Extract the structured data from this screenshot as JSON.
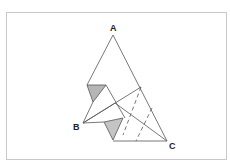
{
  "figure": {
    "type": "geometry",
    "labels": {
      "A": "A",
      "B": "B",
      "C": "C"
    },
    "points": {
      "A": [
        113,
        35
      ],
      "B": [
        83,
        123
      ],
      "C": [
        167,
        141
      ],
      "P1": [
        87,
        85
      ],
      "P2": [
        106,
        85
      ],
      "P3": [
        93,
        102
      ],
      "Q1": [
        104,
        122
      ],
      "Q2": [
        123,
        118
      ],
      "Q3": [
        113,
        140
      ],
      "M": [
        141,
        87
      ],
      "N": [
        115,
        103
      ]
    },
    "colors": {
      "line": "#555555",
      "shade": "#b5b5b5",
      "frame": "#c8c8c8"
    }
  }
}
